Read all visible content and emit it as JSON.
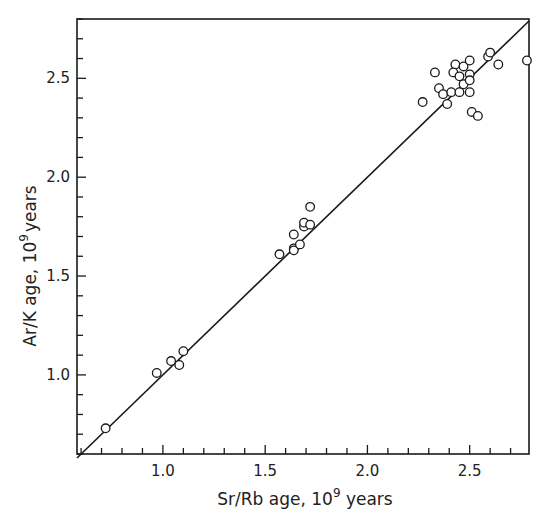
{
  "chart_data": {
    "type": "scatter",
    "title": "",
    "xlabel": "Sr/Rb  age, 10^9 years",
    "ylabel": "Ar/K  age, 10^9 years",
    "xlabel_parts": {
      "main": "Sr/Rb  age, 10",
      "sup": "9",
      "tail": " years"
    },
    "ylabel_parts": {
      "main": "Ar/K  age, 10",
      "sup": "9",
      "tail": "years"
    },
    "xlim": [
      0.58,
      2.79
    ],
    "ylim": [
      0.6,
      2.8
    ],
    "x_ticks_major": [
      1.0,
      1.5,
      2.0,
      2.5
    ],
    "x_tick_labels": [
      "1.0",
      "1.5",
      "2.0",
      "2.5"
    ],
    "x_ticks_minor_step": 0.1,
    "y_ticks_major": [
      1.0,
      1.5,
      2.0,
      2.5
    ],
    "y_tick_labels": [
      "1.0",
      "1.5",
      "2.0",
      "2.5"
    ],
    "y_ticks_minor_step": 0.1,
    "grid": false,
    "legend": null,
    "reference_line": {
      "label": "1:1 line (y = x)",
      "from": [
        0.58,
        0.58
      ],
      "to": [
        2.8,
        2.8
      ]
    },
    "marker": "open-circle",
    "series": [
      {
        "name": "samples",
        "points": [
          [
            0.72,
            0.73
          ],
          [
            0.97,
            1.01
          ],
          [
            1.04,
            1.07
          ],
          [
            1.08,
            1.05
          ],
          [
            1.1,
            1.12
          ],
          [
            1.57,
            1.61
          ],
          [
            1.64,
            1.64
          ],
          [
            1.64,
            1.63
          ],
          [
            1.64,
            1.71
          ],
          [
            1.67,
            1.66
          ],
          [
            1.69,
            1.75
          ],
          [
            1.69,
            1.77
          ],
          [
            1.72,
            1.76
          ],
          [
            1.72,
            1.85
          ],
          [
            2.27,
            2.38
          ],
          [
            2.33,
            2.53
          ],
          [
            2.35,
            2.45
          ],
          [
            2.37,
            2.42
          ],
          [
            2.39,
            2.37
          ],
          [
            2.41,
            2.43
          ],
          [
            2.43,
            2.57
          ],
          [
            2.42,
            2.53
          ],
          [
            2.45,
            2.43
          ],
          [
            2.45,
            2.51
          ],
          [
            2.47,
            2.56
          ],
          [
            2.47,
            2.47
          ],
          [
            2.5,
            2.59
          ],
          [
            2.5,
            2.52
          ],
          [
            2.5,
            2.49
          ],
          [
            2.5,
            2.43
          ],
          [
            2.51,
            2.33
          ],
          [
            2.54,
            2.31
          ],
          [
            2.59,
            2.61
          ],
          [
            2.6,
            2.63
          ],
          [
            2.64,
            2.57
          ],
          [
            2.78,
            2.59
          ]
        ]
      }
    ]
  },
  "layout": {
    "plot": {
      "left": 77,
      "top": 19,
      "right": 529,
      "bottom": 454
    },
    "colors": {
      "ink": "#1a1a1a",
      "background": "#ffffff"
    }
  }
}
